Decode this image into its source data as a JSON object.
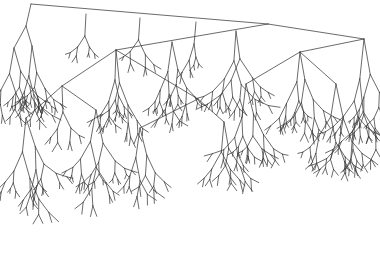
{
  "figure": {
    "title": "",
    "kind": "recursive-binary-fractal-tree",
    "width": 380,
    "height": 271,
    "background_color": "#ffffff",
    "line_color": "#3a3a3a",
    "line_width": 0.75,
    "line_cap": "round"
  },
  "chart_data": {
    "type": "line",
    "title": "",
    "subtitle": "",
    "xlabel": "",
    "ylabel": "",
    "xlim": [
      0,
      380
    ],
    "ylim": [
      0,
      271
    ],
    "grid": false,
    "legend": null,
    "annotations": [],
    "tick_labels": {
      "x": [],
      "y": []
    },
    "structure": {
      "root": {
        "x": 31,
        "y": 4
      },
      "depth_levels": 8,
      "branch_factor": 2,
      "growth_direction": "downward",
      "initial_branches": [
        {
          "from": [
            31,
            4
          ],
          "to": [
            268,
            24
          ],
          "level": 1,
          "side": "right"
        },
        {
          "from": [
            31,
            4
          ],
          "to": [
            26,
            26
          ],
          "level": 1,
          "side": "left"
        }
      ],
      "major_nodes": [
        {
          "id": "root",
          "x": 31,
          "y": 4,
          "level": 0
        },
        {
          "id": "n-left",
          "x": 26,
          "y": 26,
          "level": 1
        },
        {
          "id": "n-right",
          "x": 268,
          "y": 24,
          "level": 1
        },
        {
          "id": "n-right-left",
          "x": 116,
          "y": 50,
          "level": 2
        },
        {
          "id": "n-right-right",
          "x": 364,
          "y": 39,
          "level": 2
        },
        {
          "id": "n-rr-left",
          "x": 300,
          "y": 52,
          "level": 3
        },
        {
          "id": "n-rl-right",
          "x": 198,
          "y": 99,
          "level": 3
        }
      ],
      "length_decay": 0.68,
      "angle_spread_deg": 52,
      "random_seed": 20240917,
      "terminal_y_max": 266,
      "x_extent": [
        8,
        372
      ]
    },
    "series": [
      {
        "name": "tree-edges",
        "note": "Edge geometry is generated recursively from the structure parameters above; every segment is a straight line from parent node to child node.",
        "values": []
      }
    ]
  },
  "canvas": {
    "aria_label": "Fractal binary tree diagram"
  }
}
